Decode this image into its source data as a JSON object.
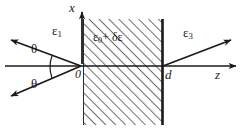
{
  "figure": {
    "background": "#ffffff",
    "ink": "#1a1a1a",
    "hatch_color": "#4a4a4a"
  },
  "axes": {
    "x_axis": {
      "label": "x",
      "icon": "arrow-up-icon"
    },
    "z_axis": {
      "label": "z",
      "icon": "arrow-right-icon"
    },
    "origin_label": "0",
    "thickness_label": "d"
  },
  "regions": {
    "left": {
      "label_eps": "ε",
      "label_sub": "1"
    },
    "slab": {
      "label_eps0": "ε",
      "label_sub0": "0",
      "label_plus": "+ ",
      "label_delta": "δε"
    },
    "right": {
      "label_eps": "ε",
      "label_sub": "3"
    }
  },
  "angles": {
    "upper": "θ",
    "lower": "θ"
  },
  "rays": {
    "reflected": "reflected-ray",
    "incident": "incident-ray",
    "transmitted": "transmitted-ray"
  }
}
